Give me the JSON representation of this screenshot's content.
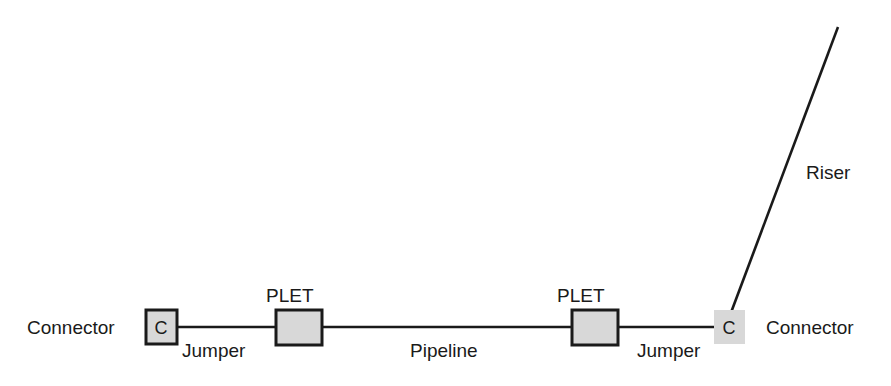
{
  "diagram": {
    "background_color": "#ffffff",
    "line_color": "#1a1a1a",
    "box_fill_color": "#d8d8d8",
    "box_border_color": "#1a1a1a",
    "labels": {
      "connector_left": "Connector",
      "jumper_left": "Jumper",
      "plet_left": "PLET",
      "pipeline": "Pipeline",
      "plet_right": "PLET",
      "jumper_right": "Jumper",
      "connector_right": "Connector",
      "riser": "Riser"
    },
    "components": {
      "connector_left_letter": "C",
      "connector_right_letter": "C"
    }
  }
}
